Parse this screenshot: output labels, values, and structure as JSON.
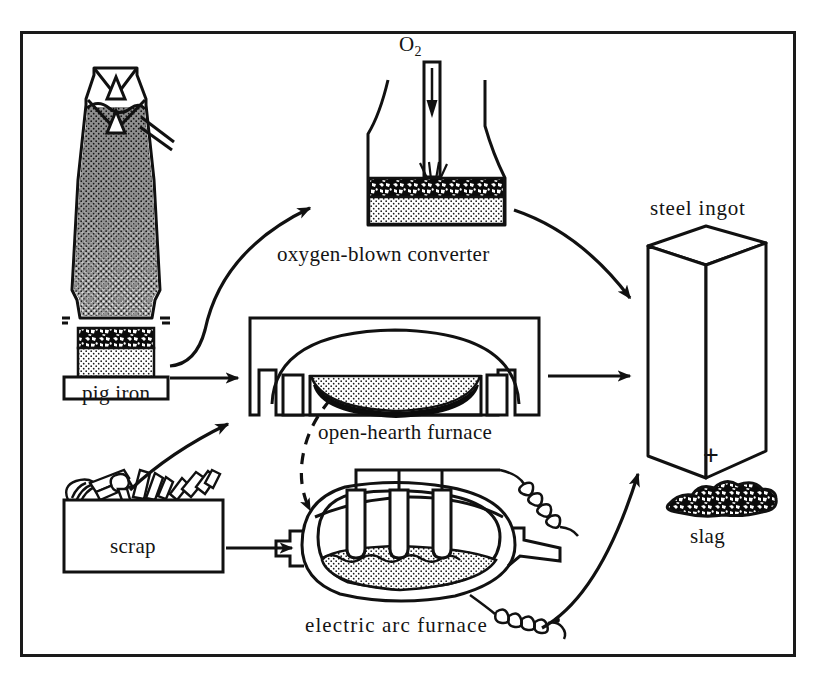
{
  "figure": {
    "type": "process-flow-diagram",
    "border_color": "#1a1a1a",
    "ink_color": "#111111",
    "background": "#ffffff"
  },
  "labels": {
    "pig_iron": "pig iron",
    "oxygen_blown_converter": "oxygen-blown converter",
    "open_hearth_furnace": "open-hearth furnace",
    "electric_arc_furnace": "electric arc furnace",
    "scrap": "scrap",
    "steel_ingot": "steel ingot",
    "slag": "slag",
    "oxygen_formula": "O",
    "oxygen_subscript": "2",
    "plus_sign": "+"
  },
  "nodes": [
    {
      "id": "blast-furnace",
      "label": "pig iron",
      "role": "source",
      "note": "blast furnace with double bell charging top, dark coke/ore burden, slag band and molten pig iron at hearth"
    },
    {
      "id": "converter",
      "label": "oxygen-blown converter",
      "role": "process",
      "note": "pear-shaped vessel with vertical oxygen lance blowing onto slag and metal bath"
    },
    {
      "id": "open-hearth",
      "label": "open-hearth furnace",
      "role": "process",
      "note": "rectangular furnace with arched roof, shallow lens-shaped bath with slag above metal"
    },
    {
      "id": "electric-arc",
      "label": "electric arc furnace",
      "role": "process",
      "note": "barrel-shaped shell with three graphite electrodes, tapping spout and power cables"
    },
    {
      "id": "scrap",
      "label": "scrap",
      "role": "source",
      "note": "open box heaped with scrap steel pieces"
    },
    {
      "id": "steel-ingot",
      "label": "steel ingot",
      "role": "product",
      "note": "rectangular cast ingot drawn in perspective"
    },
    {
      "id": "slag",
      "label": "slag",
      "role": "product",
      "note": "irregular lump with coarse granular texture"
    }
  ],
  "edges": [
    {
      "from": "blast-furnace",
      "to": "converter",
      "style": "curved-arrow",
      "label": ""
    },
    {
      "from": "blast-furnace",
      "to": "open-hearth",
      "style": "straight-arrow",
      "label": ""
    },
    {
      "from": "scrap",
      "to": "open-hearth",
      "style": "curved-arrow",
      "label": ""
    },
    {
      "from": "scrap",
      "to": "electric-arc",
      "style": "straight-arrow",
      "label": ""
    },
    {
      "from": "open-hearth",
      "to": "electric-arc",
      "style": "dashed-arrow",
      "label": ""
    },
    {
      "from": "converter",
      "to": "steel-ingot",
      "style": "curved-arrow",
      "label": ""
    },
    {
      "from": "open-hearth",
      "to": "steel-ingot",
      "style": "straight-arrow",
      "label": ""
    },
    {
      "from": "electric-arc",
      "to": "steel-ingot",
      "style": "curved-arrow",
      "label": ""
    }
  ],
  "inputs": [
    {
      "id": "oxygen",
      "label": "O2",
      "target": "converter",
      "style": "down-arrow-through-lance"
    }
  ]
}
